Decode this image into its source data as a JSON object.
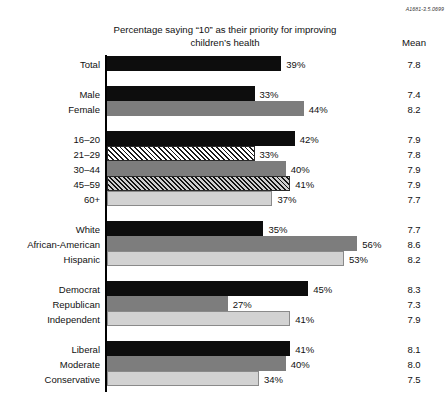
{
  "corner_code": "A1681-3.5.0699",
  "title": "Percentage saying “10” as their priority for improving children’s health",
  "mean_header": "Mean",
  "chart_data": {
    "type": "bar",
    "title": "Percentage saying “10” as their priority for improving children’s health",
    "xlabel": "",
    "ylabel": "",
    "orientation": "horizontal",
    "xlim": [
      0,
      60
    ],
    "grid": false,
    "legend": "none",
    "value_suffix": "%",
    "extra_column": {
      "header": "Mean",
      "values": [
        7.8,
        7.4,
        8.2,
        7.9,
        7.8,
        7.9,
        7.9,
        7.7,
        7.7,
        8.6,
        8.2,
        8.3,
        7.3,
        7.9,
        8.1,
        8.0,
        7.5
      ]
    },
    "categories": [
      "Total",
      "Male",
      "Female",
      "16–20",
      "21–29",
      "30–44",
      "45–59",
      "60+",
      "White",
      "African-American",
      "Hispanic",
      "Democrat",
      "Republican",
      "Independent",
      "Liberal",
      "Moderate",
      "Conservative"
    ],
    "values": [
      39,
      33,
      44,
      42,
      33,
      40,
      41,
      37,
      35,
      56,
      53,
      45,
      27,
      41,
      41,
      40,
      34
    ],
    "groups": [
      {
        "name": "total",
        "rows": [
          {
            "label": "Total",
            "value": 39,
            "value_label": "39%",
            "mean": "7.8",
            "fill": "black"
          }
        ]
      },
      {
        "name": "gender",
        "rows": [
          {
            "label": "Male",
            "value": 33,
            "value_label": "33%",
            "mean": "7.4",
            "fill": "black"
          },
          {
            "label": "Female",
            "value": 44,
            "value_label": "44%",
            "mean": "8.2",
            "fill": "gray"
          }
        ]
      },
      {
        "name": "age",
        "rows": [
          {
            "label": "16–20",
            "value": 42,
            "value_label": "42%",
            "mean": "7.9",
            "fill": "black"
          },
          {
            "label": "21–29",
            "value": 33,
            "value_label": "33%",
            "mean": "7.8",
            "fill": "hatch-light"
          },
          {
            "label": "30–44",
            "value": 40,
            "value_label": "40%",
            "mean": "7.9",
            "fill": "gray"
          },
          {
            "label": "45–59",
            "value": 41,
            "value_label": "41%",
            "mean": "7.9",
            "fill": "hatch-dark"
          },
          {
            "label": "60+",
            "value": 37,
            "value_label": "37%",
            "mean": "7.7",
            "fill": "light"
          }
        ]
      },
      {
        "name": "ethnicity",
        "rows": [
          {
            "label": "White",
            "value": 35,
            "value_label": "35%",
            "mean": "7.7",
            "fill": "black"
          },
          {
            "label": "African-American",
            "value": 56,
            "value_label": "56%",
            "mean": "8.6",
            "fill": "gray"
          },
          {
            "label": "Hispanic",
            "value": 53,
            "value_label": "53%",
            "mean": "8.2",
            "fill": "light"
          }
        ]
      },
      {
        "name": "party",
        "rows": [
          {
            "label": "Democrat",
            "value": 45,
            "value_label": "45%",
            "mean": "8.3",
            "fill": "black"
          },
          {
            "label": "Republican",
            "value": 27,
            "value_label": "27%",
            "mean": "7.3",
            "fill": "gray"
          },
          {
            "label": "Independent",
            "value": 41,
            "value_label": "41%",
            "mean": "7.9",
            "fill": "light"
          }
        ]
      },
      {
        "name": "ideology",
        "rows": [
          {
            "label": "Liberal",
            "value": 41,
            "value_label": "41%",
            "mean": "8.1",
            "fill": "black"
          },
          {
            "label": "Moderate",
            "value": 40,
            "value_label": "40%",
            "mean": "8.0",
            "fill": "gray"
          },
          {
            "label": "Conservative",
            "value": 34,
            "value_label": "34%",
            "mean": "7.5",
            "fill": "light"
          }
        ]
      }
    ]
  }
}
